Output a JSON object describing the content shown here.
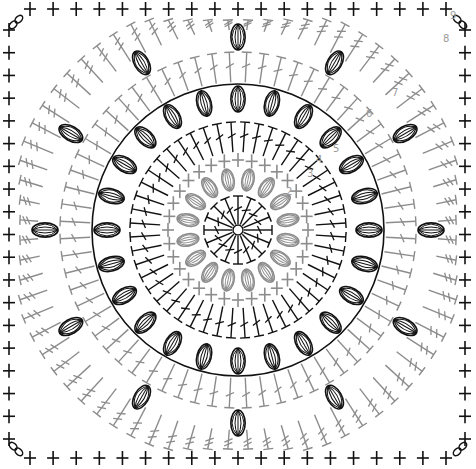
{
  "diagram": {
    "type": "crochet-chart",
    "shape": "square-from-circle",
    "width": 476,
    "height": 469,
    "center": [
      238,
      230
    ],
    "colors": {
      "background": "#ffffff",
      "black": "#111111",
      "grey": "#8c8c8c",
      "label": "#9a9a9a"
    },
    "row_labels": [
      {
        "text": "2",
        "x": 286,
        "y": 195
      },
      {
        "text": "3",
        "x": 307,
        "y": 177
      },
      {
        "text": "4",
        "x": 316,
        "y": 163
      },
      {
        "text": "5",
        "x": 333,
        "y": 152
      },
      {
        "text": "6",
        "x": 366,
        "y": 117
      },
      {
        "text": "7",
        "x": 392,
        "y": 96
      },
      {
        "text": "8",
        "x": 443,
        "y": 42
      },
      {
        "text": "9",
        "x": 450,
        "y": 19
      }
    ],
    "rounds": [
      {
        "id": 1,
        "stitch": "dc",
        "color": "black",
        "r_in": 6,
        "r_out": 34,
        "count": 16
      },
      {
        "id": 2,
        "stitch": "puff",
        "color": "grey",
        "r_in": 40,
        "r_out": 62,
        "count": 16
      },
      {
        "id": 3,
        "stitch": "sc",
        "color": "grey",
        "r_in": 62,
        "r_out": 78,
        "count": 32
      },
      {
        "id": 4,
        "stitch": "dc",
        "color": "black",
        "r_in": 78,
        "r_out": 108,
        "count": 48
      },
      {
        "id": 5,
        "stitch": "puff",
        "color": "black",
        "r_in": 118,
        "r_out": 144,
        "count": 24,
        "ring": 146
      },
      {
        "id": 6,
        "stitch": "dc",
        "color": "grey",
        "r_in": 148,
        "r_out": 178,
        "count": 64
      },
      {
        "id": 7,
        "stitch": "puff",
        "color": "black",
        "r_in": 180,
        "r_out": 206,
        "count": 12
      },
      {
        "id": 8,
        "stitch": "tr",
        "color": "grey",
        "r_in": 200,
        "r_out": 232,
        "count": 72
      },
      {
        "id": 9,
        "stitch": "sc-border",
        "color": "black",
        "per_side": 19
      }
    ],
    "legend_icons": [
      "chain-icon",
      "single-crochet-icon",
      "double-crochet-icon",
      "puff-stitch-icon"
    ]
  }
}
